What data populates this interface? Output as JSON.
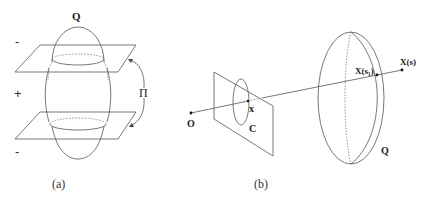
{
  "panel_a": {
    "caption": "(a)",
    "quadric_label": "Q",
    "planes_label": "Π",
    "region_signs": [
      "-",
      "+",
      "-"
    ]
  },
  "panel_b": {
    "caption": "(b)",
    "center_label": "O",
    "image_point_label": "x",
    "conic_label": "C",
    "quadric_label": "Q",
    "intersection_label": "X(s₁)",
    "ray_point_label": "X(s)"
  }
}
